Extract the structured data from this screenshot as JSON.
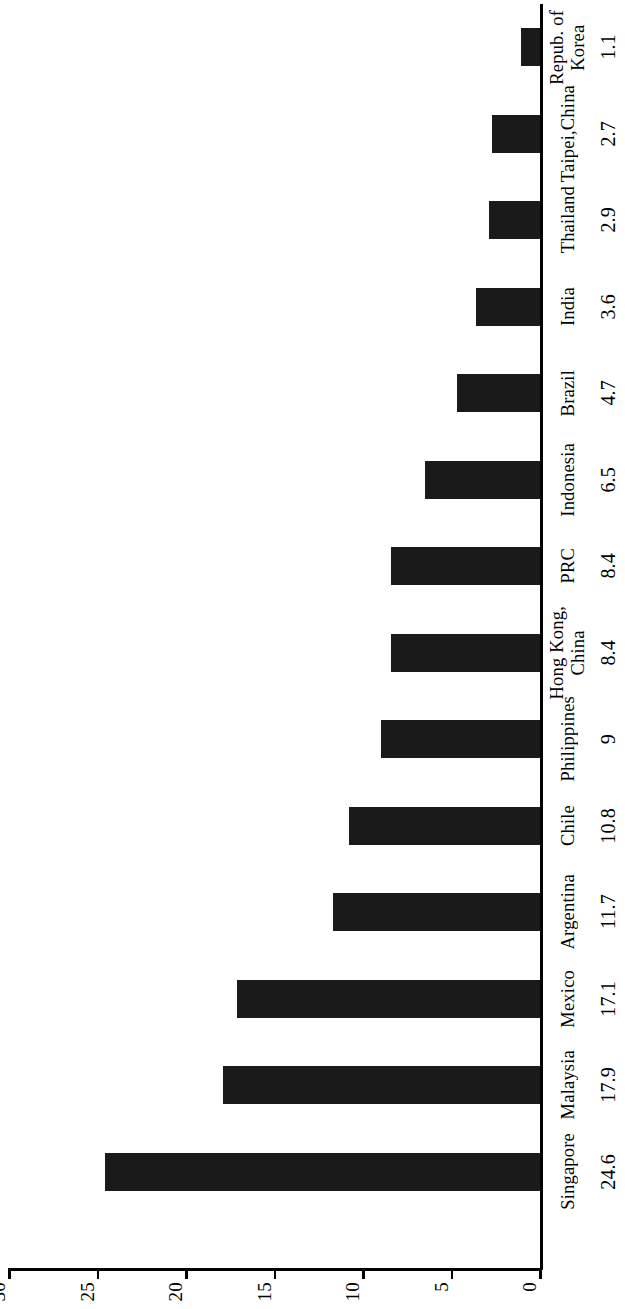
{
  "chart_data": {
    "type": "bar",
    "orientation": "horizontal-rotated",
    "title": "",
    "subtitle": "",
    "xlabel": "",
    "ylabel": "",
    "categories": [
      "Singapore",
      "Malaysia",
      "Mexico",
      "Argentina",
      "Chile",
      "Philippines",
      "Hong Kong, China",
      "PRC",
      "Indonesia",
      "Brazil",
      "India",
      "Thailand",
      "Taipei,China",
      "Repub. of Korea"
    ],
    "category_lines": [
      [
        "Singapore"
      ],
      [
        "Malaysia"
      ],
      [
        "Mexico"
      ],
      [
        "Argentina"
      ],
      [
        "Chile"
      ],
      [
        "Philippines"
      ],
      [
        "Hong Kong,",
        "China"
      ],
      [
        "PRC"
      ],
      [
        "Indonesia"
      ],
      [
        "Brazil"
      ],
      [
        "India"
      ],
      [
        "Thailand"
      ],
      [
        "Taipei,China"
      ],
      [
        "Repub. of",
        "Korea"
      ]
    ],
    "values": [
      24.6,
      17.9,
      17.1,
      11.7,
      10.8,
      9,
      8.4,
      8.4,
      6.5,
      4.7,
      3.6,
      2.9,
      2.7,
      1.1
    ],
    "value_labels": [
      "24.6",
      "17.9",
      "17.1",
      "11.7",
      "10.8",
      "9",
      "8.4",
      "8.4",
      "6.5",
      "4.7",
      "3.6",
      "2.9",
      "2.7",
      "1.1"
    ],
    "ylim": [
      0,
      30
    ],
    "axis_ticks": [
      30,
      25,
      20,
      15,
      10,
      5,
      0
    ],
    "axis_tick_labels": [
      "30",
      "25",
      "20",
      "15",
      "10",
      "5",
      "0"
    ],
    "grid": false,
    "legend": null,
    "bar_color": "#1a1a1a",
    "background_color": "#ffffff",
    "axis_color": "#000000"
  }
}
